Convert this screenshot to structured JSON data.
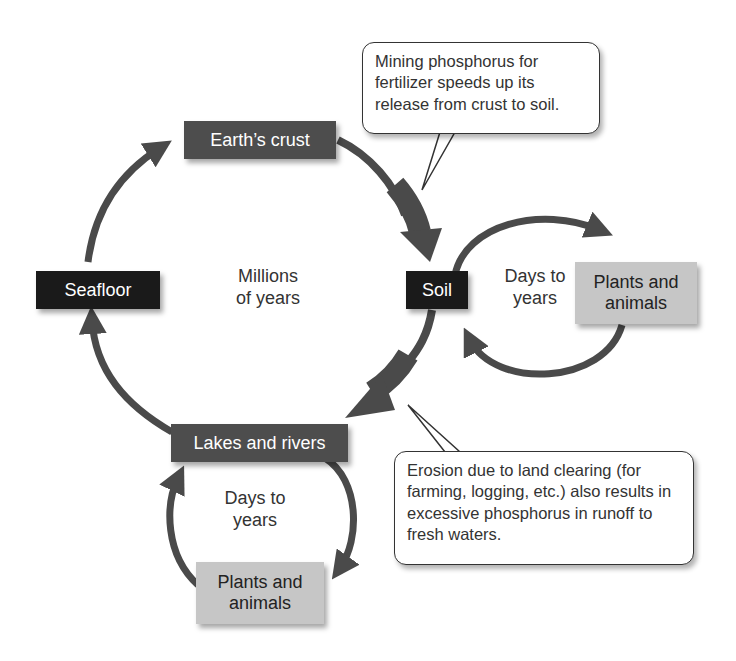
{
  "diagram": {
    "nodes": {
      "earths_crust": "Earth’s crust",
      "seafloor": "Seafloor",
      "soil": "Soil",
      "lakes_rivers": "Lakes and rivers",
      "plants_animals_right_l1": "Plants and",
      "plants_animals_right_l2": "animals",
      "plants_animals_bottom_l1": "Plants and",
      "plants_animals_bottom_l2": "animals"
    },
    "labels": {
      "main_cycle_l1": "Millions",
      "main_cycle_l2": "of years",
      "soil_cycle_l1": "Days to",
      "soil_cycle_l2": "years",
      "lakes_cycle_l1": "Days to",
      "lakes_cycle_l2": "years"
    },
    "callouts": {
      "mining": "Mining phosphorus for fertilizer speeds up its release from crust to soil.",
      "erosion": "Erosion due to land clearing (for farming, logging, etc.) also results in excessive phosphorus in runoff to fresh waters."
    },
    "edges": [
      {
        "from": "Earth’s crust",
        "to": "Soil",
        "emphasis": "thick"
      },
      {
        "from": "Soil",
        "to": "Lakes and rivers",
        "emphasis": "thick"
      },
      {
        "from": "Lakes and rivers",
        "to": "Seafloor"
      },
      {
        "from": "Seafloor",
        "to": "Earth’s crust"
      },
      {
        "from": "Soil",
        "to": "Plants and animals"
      },
      {
        "from": "Plants and animals",
        "to": "Soil"
      },
      {
        "from": "Lakes and rivers",
        "to": "Plants and animals"
      },
      {
        "from": "Plants and animals",
        "to": "Lakes and rivers"
      }
    ],
    "colors": {
      "arrow": "#4a4a4a",
      "dark_box": "#1a1a1a",
      "mid_box": "#4d4d4d",
      "light_box": "#c6c6c6"
    }
  }
}
